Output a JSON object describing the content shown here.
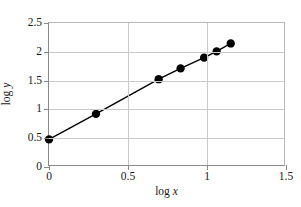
{
  "chart_data": {
    "type": "line",
    "title": "",
    "subtitle": "",
    "xlabel": "log x",
    "ylabel": "log y",
    "xlabel_prefix": "log",
    "xlabel_var": "x",
    "ylabel_prefix": "log",
    "ylabel_var": "y",
    "xlim": [
      0,
      1.5
    ],
    "ylim": [
      0,
      2.5
    ],
    "xticks": [
      0,
      0.5,
      1,
      1.5
    ],
    "xticklabels": [
      "0",
      "0.5",
      "1",
      "1.5"
    ],
    "yticks": [
      0,
      0.5,
      1,
      1.5,
      2,
      2.5
    ],
    "yticklabels": [
      "0",
      "0.5",
      "1",
      "1.5",
      "2",
      "2.5"
    ],
    "grid": {
      "horizontal": true,
      "vertical": true,
      "color": "#c9c9c9"
    },
    "legend": null,
    "legend_position": "none",
    "series": [
      {
        "name": "data",
        "marker": "filled-circle",
        "marker_size": 4.2,
        "line_style": "solid",
        "line_width": 1.4,
        "color": "#000000",
        "x": [
          0.0,
          0.3,
          0.7,
          0.84,
          0.99,
          1.07,
          1.16
        ],
        "y": [
          0.45,
          0.9,
          1.51,
          1.7,
          1.89,
          2.0,
          2.14
        ],
        "points": [
          {
            "x": 0.0,
            "y": 0.45
          },
          {
            "x": 0.3,
            "y": 0.9
          },
          {
            "x": 0.7,
            "y": 1.51
          },
          {
            "x": 0.84,
            "y": 1.7
          },
          {
            "x": 0.99,
            "y": 1.89
          },
          {
            "x": 1.07,
            "y": 2.0
          },
          {
            "x": 1.16,
            "y": 2.14
          }
        ]
      }
    ],
    "annotations": [],
    "colors": {
      "axis": "#8a8a8a",
      "grid": "#c9c9c9",
      "data": "#000000",
      "text": "#1a1a1a",
      "background": "#ffffff"
    }
  }
}
